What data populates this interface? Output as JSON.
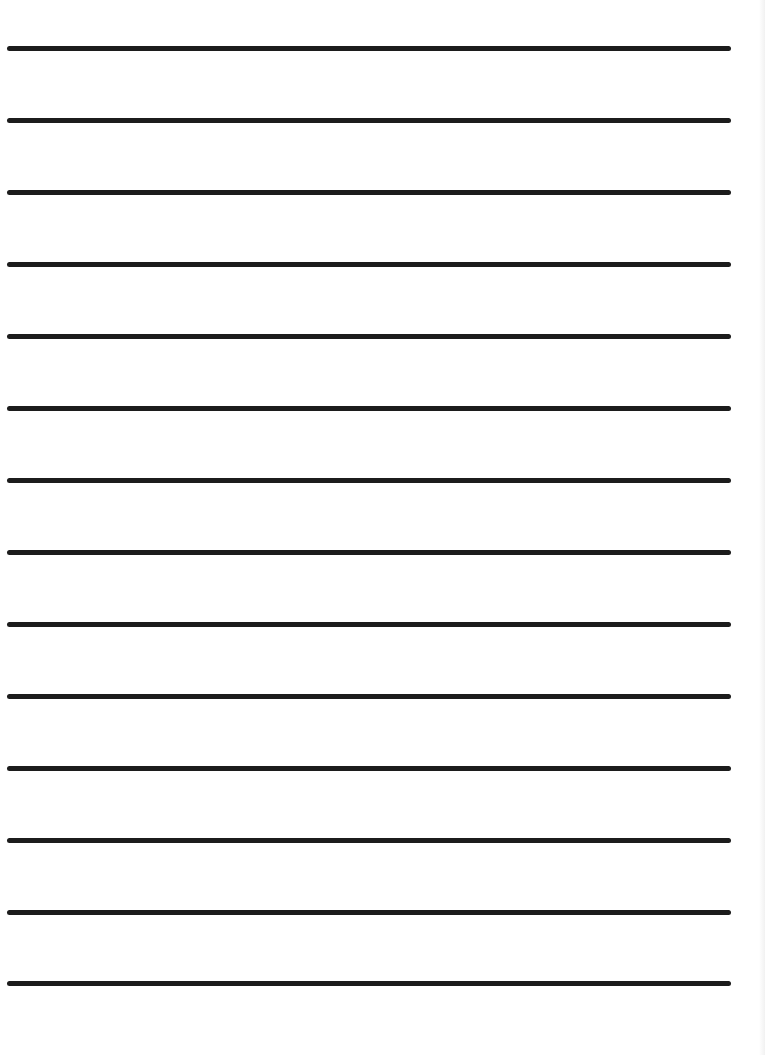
{
  "document": {
    "type": "lined-paper",
    "background_color": "#ffffff",
    "line_color": "#1c1c1c",
    "line_count": 14,
    "lines": [
      {
        "y": 46
      },
      {
        "y": 118
      },
      {
        "y": 190
      },
      {
        "y": 262
      },
      {
        "y": 334
      },
      {
        "y": 406
      },
      {
        "y": 478
      },
      {
        "y": 550
      },
      {
        "y": 622
      },
      {
        "y": 694
      },
      {
        "y": 766
      },
      {
        "y": 838
      },
      {
        "y": 910
      },
      {
        "y": 981
      }
    ]
  }
}
